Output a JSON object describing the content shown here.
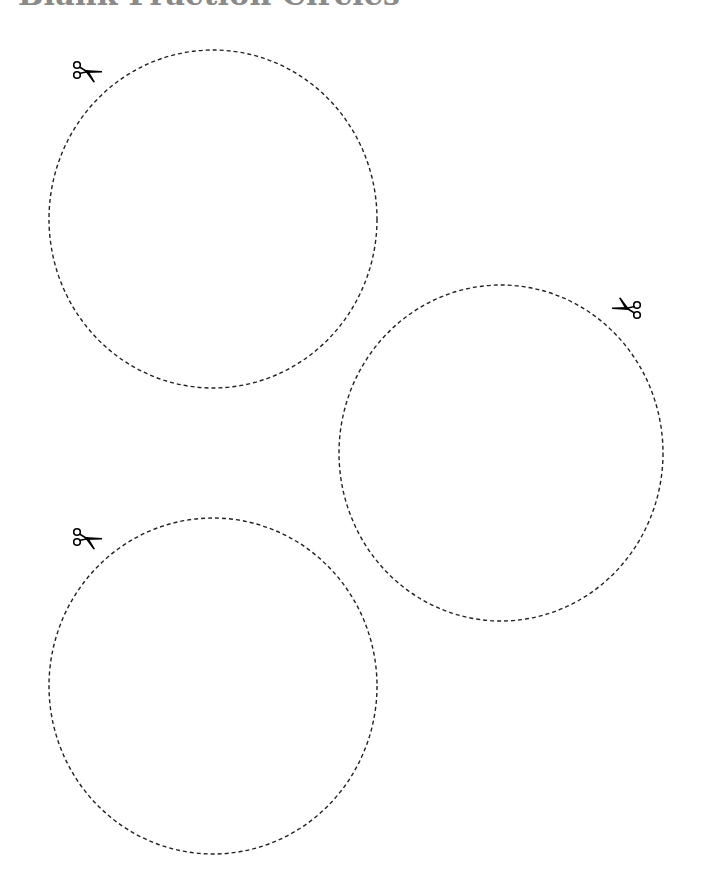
{
  "page": {
    "title": "Blank Fraction Circles"
  },
  "colors": {
    "title": "#8a8a8a",
    "cut_line": "#222222",
    "scissors": "#000000",
    "background": "#ffffff"
  },
  "circles": [
    {
      "id": 1,
      "cx": 213,
      "cy": 219,
      "rx": 164,
      "ry": 169,
      "scissors": {
        "x": 88,
        "y": 72,
        "direction": "right"
      }
    },
    {
      "id": 2,
      "cx": 501,
      "cy": 453,
      "rx": 162,
      "ry": 168,
      "scissors": {
        "x": 626,
        "y": 306,
        "direction": "left"
      }
    },
    {
      "id": 3,
      "cx": 213,
      "cy": 686,
      "rx": 164,
      "ry": 168,
      "scissors": {
        "x": 88,
        "y": 538,
        "direction": "right"
      }
    }
  ],
  "icons": {
    "scissors": "scissors-icon"
  }
}
